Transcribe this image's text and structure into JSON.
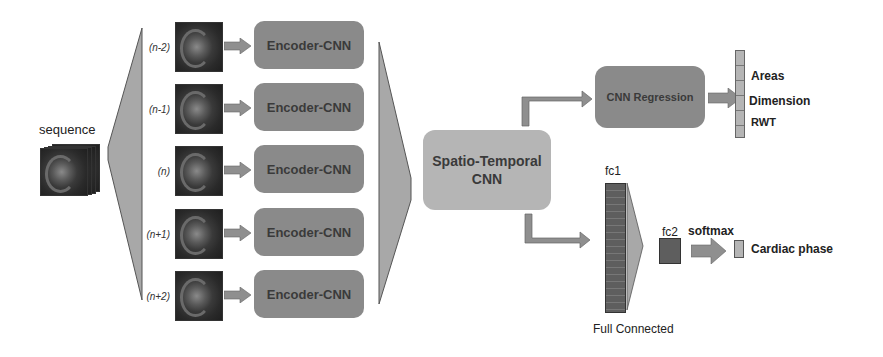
{
  "input": {
    "label": "sequence"
  },
  "frames": [
    {
      "index_label": "(n-2)",
      "encoder_label": "Encoder-CNN"
    },
    {
      "index_label": "(n-1)",
      "encoder_label": "Encoder-CNN"
    },
    {
      "index_label": "(n)",
      "encoder_label": "Encoder-CNN"
    },
    {
      "index_label": "(n+1)",
      "encoder_label": "Encoder-CNN"
    },
    {
      "index_label": "(n+2)",
      "encoder_label": "Encoder-CNN"
    }
  ],
  "spatio_temporal": {
    "line1": "Spatio-Temporal",
    "line2": "CNN"
  },
  "regression": {
    "label": "CNN Regression",
    "outputs": [
      "Areas",
      "Dimension",
      "RWT"
    ]
  },
  "classification": {
    "fc1_label": "fc1",
    "fc2_label": "fc2",
    "softmax_label": "softmax",
    "output_label": "Cardiac phase",
    "caption": "Full Connected"
  },
  "colors": {
    "encoder_fill": "#8a8a8a",
    "st_fill": "#b5b5b5",
    "funnel_fill": "#a8a8a8",
    "arrow_fill": "#8f8f8f",
    "fc_fill": "#5e5e5e"
  }
}
